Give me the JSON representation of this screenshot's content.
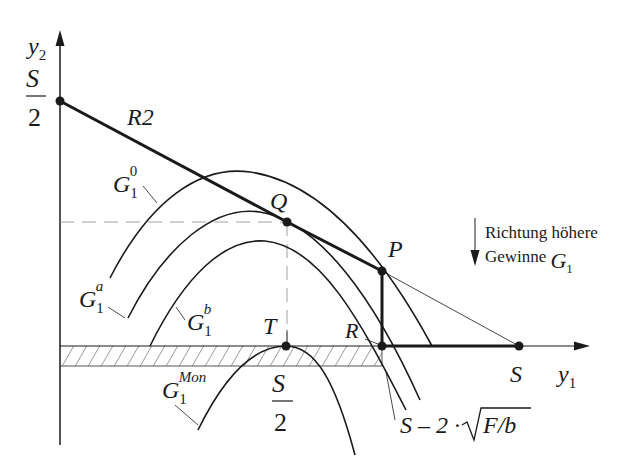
{
  "axes": {
    "y_label": "y",
    "y_label_sub": "2",
    "x_label": "y",
    "x_label_sub": "1",
    "y_tick_num": "S",
    "y_tick_den": "2",
    "x_tick_mid_num": "S",
    "x_tick_mid_den": "2",
    "x_tick_end": "S"
  },
  "lines": {
    "reaction_line": "R2"
  },
  "points": {
    "Q": "Q",
    "P": "P",
    "T": "T",
    "R": "R"
  },
  "curves": {
    "g0": {
      "base": "G",
      "sub": "1",
      "sup": "0"
    },
    "ga": {
      "base": "G",
      "sub": "1",
      "sup": "a"
    },
    "gb": {
      "base": "G",
      "sub": "1",
      "sup": "b"
    },
    "gmon": {
      "base": "G",
      "sub": "1",
      "sup": "Mon"
    }
  },
  "annotation": {
    "line1": "Richtung höhere",
    "line2": "Gewinne",
    "symbol": "G",
    "symbol_sub": "1"
  },
  "formula": {
    "prefix": "S – 2 ·",
    "radicand": "F/b"
  },
  "colors": {
    "ink": "#1a1a1a",
    "guide": "#8a8a8a"
  }
}
